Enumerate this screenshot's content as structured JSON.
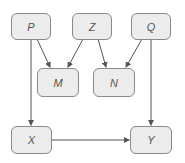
{
  "diagram": {
    "type": "directed-graph",
    "nodes": [
      {
        "id": "P",
        "label": "P"
      },
      {
        "id": "Z",
        "label": "Z"
      },
      {
        "id": "Q",
        "label": "Q"
      },
      {
        "id": "M",
        "label": "M"
      },
      {
        "id": "N",
        "label": "N"
      },
      {
        "id": "X",
        "label": "X"
      },
      {
        "id": "Y",
        "label": "Y"
      }
    ],
    "edges": [
      {
        "from": "P",
        "to": "M"
      },
      {
        "from": "P",
        "to": "X"
      },
      {
        "from": "Z",
        "to": "M"
      },
      {
        "from": "Z",
        "to": "N"
      },
      {
        "from": "Q",
        "to": "N"
      },
      {
        "from": "Q",
        "to": "Y"
      },
      {
        "from": "X",
        "to": "Y"
      }
    ]
  },
  "colors": {
    "node_fill": "#ececec",
    "node_border": "#8a8a8a",
    "edge": "#555555",
    "label": "#555555"
  }
}
